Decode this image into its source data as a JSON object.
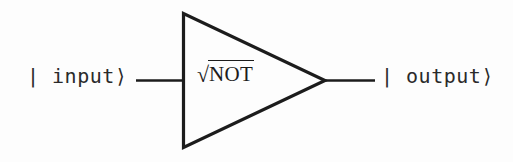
{
  "figure": {
    "name": "sqrt-not-quantum-gate-diagram",
    "background_color": "#fdfdfd",
    "ink_color": "#1c1c1c"
  },
  "input": {
    "label": "| input⟩",
    "ket_state": "input"
  },
  "output": {
    "label": "| output⟩",
    "ket_state": "output"
  },
  "gate": {
    "radical_symbol": "√",
    "radicand": "NOT",
    "full_label": "√NOT",
    "shape": "triangle"
  },
  "wires": {
    "input_wire": "input-wire",
    "output_wire": "output-wire"
  }
}
